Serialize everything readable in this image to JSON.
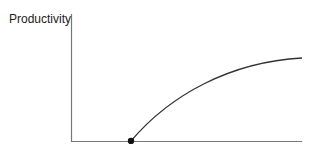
{
  "diagram": {
    "y_axis_label": "Productivity",
    "x_axis_label": "",
    "curve": {
      "description": "concave increasing curve starting at a point on the x-axis and leveling off",
      "start_point": {
        "x": 131,
        "y": 141
      },
      "end_point": {
        "x": 302,
        "y": 58
      },
      "path": "M131,141 C170,95 230,62 302,58"
    },
    "marker": {
      "shape": "dot",
      "x": 131,
      "y": 141
    },
    "colors": {
      "axis": "#777777",
      "curve": "#333333",
      "marker": "#111111"
    }
  }
}
